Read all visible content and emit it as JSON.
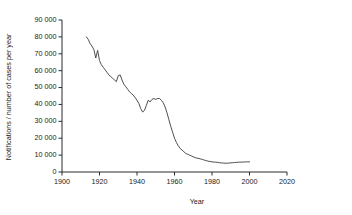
{
  "chart_data": {
    "type": "line",
    "title": "",
    "subtitle": "",
    "xlabel": "Year",
    "ylabel": "Notifications / number of cases per year",
    "xlim": [
      1900,
      2020
    ],
    "ylim": [
      0,
      90000
    ],
    "xticks": [
      1900,
      1920,
      1940,
      1960,
      1980,
      2000,
      2020
    ],
    "xtick_labels": [
      "1900",
      "1920",
      "1940",
      "1960",
      "1980",
      "2000",
      "2020"
    ],
    "yticks": [
      0,
      10000,
      20000,
      30000,
      40000,
      50000,
      60000,
      70000,
      80000,
      90000
    ],
    "ytick_labels": [
      "0",
      "10 000",
      "20 000",
      "30 000",
      "40 000",
      "50 000",
      "60 000",
      "70 000",
      "80 000",
      "90 000"
    ],
    "grid": false,
    "legend": false,
    "legend_position": "none",
    "line_color": "#3a3a3a",
    "axis_color": "#2b2b2b",
    "background_color": "#ffffff",
    "series": [
      {
        "name": "Notifications",
        "x": [
          1913,
          1914,
          1915,
          1916,
          1917,
          1918,
          1919,
          1920,
          1921,
          1922,
          1923,
          1924,
          1925,
          1926,
          1927,
          1928,
          1929,
          1930,
          1931,
          1932,
          1933,
          1934,
          1935,
          1936,
          1937,
          1938,
          1939,
          1940,
          1941,
          1942,
          1943,
          1944,
          1945,
          1946,
          1947,
          1948,
          1949,
          1950,
          1951,
          1952,
          1953,
          1954,
          1955,
          1956,
          1957,
          1958,
          1959,
          1960,
          1961,
          1962,
          1963,
          1964,
          1965,
          1966,
          1967,
          1968,
          1969,
          1970,
          1971,
          1972,
          1973,
          1974,
          1975,
          1976,
          1977,
          1978,
          1979,
          1980,
          1981,
          1982,
          1983,
          1984,
          1985,
          1986,
          1987,
          1988,
          1989,
          1990,
          1991,
          1992,
          1993,
          1994,
          1995,
          1996,
          1997,
          1998,
          1999,
          2000
        ],
        "values": [
          80000,
          78500,
          76000,
          74500,
          72500,
          67500,
          72000,
          66000,
          63500,
          62000,
          60500,
          59000,
          57500,
          56500,
          55500,
          54500,
          53500,
          57000,
          57500,
          54500,
          52000,
          50500,
          49000,
          47500,
          46500,
          45500,
          44000,
          42500,
          40500,
          37500,
          35500,
          36500,
          39500,
          42500,
          41500,
          43000,
          43500,
          43000,
          43500,
          43500,
          42500,
          41000,
          38500,
          35000,
          31000,
          27000,
          23500,
          20000,
          17500,
          15500,
          14000,
          13000,
          12000,
          11000,
          10500,
          10000,
          9500,
          9000,
          8500,
          8200,
          8000,
          7700,
          7400,
          7000,
          6700,
          6400,
          6200,
          6000,
          5900,
          5800,
          5700,
          5500,
          5400,
          5300,
          5200,
          5200,
          5300,
          5400,
          5500,
          5600,
          5700,
          5800,
          5800,
          5900,
          5900,
          6000,
          6000,
          6000
        ]
      }
    ]
  },
  "axes": {
    "y_title": "Notifications / number of cases per year",
    "x_title": "Year"
  }
}
